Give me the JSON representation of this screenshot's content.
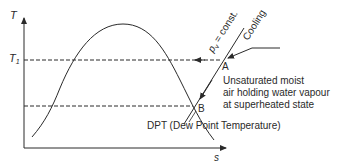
{
  "diagram": {
    "type": "T-s diagram (dew point)",
    "axes": {
      "y_label": "T",
      "x_label": "s",
      "t1_label": "T",
      "t1_subscript": "1"
    },
    "lines": {
      "pv_label": "p",
      "pv_subscript": "v",
      "pv_suffix": " = const.",
      "cooling_label": "Cooling"
    },
    "points": {
      "a_label": "A",
      "b_label": "B"
    },
    "annotations": {
      "state_line1": "Unsaturated moist",
      "state_line2": "air holding water vapour",
      "state_line3": "at superheated state",
      "dpt_label": "DPT (Dew Point Temperature)"
    },
    "colors": {
      "ink": "#2a2a2a",
      "background": "#ffffff"
    }
  }
}
